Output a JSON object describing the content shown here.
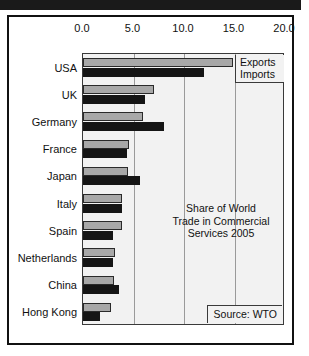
{
  "figure": {
    "inner_title_lines": [
      "Share of World",
      "Trade in Commercial",
      "Services 2005"
    ],
    "source_note": "Source: WTO",
    "legend": [
      "Exports",
      "Imports"
    ]
  },
  "chart_data": {
    "type": "bar",
    "orientation": "horizontal",
    "title": "Share of World Trade in Commercial Services 2005",
    "xlabel": "",
    "ylabel": "",
    "xlim": [
      0.0,
      20.0
    ],
    "xticks": [
      "0.0",
      "5.0",
      "10.0",
      "15.0",
      "20.0"
    ],
    "xtick_values": [
      0.0,
      5.0,
      10.0,
      15.0,
      20.0
    ],
    "grid": true,
    "legend_position": "top-right",
    "source": "Source: WTO",
    "categories": [
      "USA",
      "UK",
      "Germany",
      "France",
      "Japan",
      "Italy",
      "Spain",
      "Netherlands",
      "China",
      "Hong Kong"
    ],
    "series": [
      {
        "name": "Exports",
        "color": "#a8a8a8",
        "values": [
          14.9,
          7.0,
          5.9,
          4.6,
          4.5,
          3.9,
          3.9,
          3.2,
          3.1,
          2.8
        ]
      },
      {
        "name": "Imports",
        "color": "#151515",
        "values": [
          12.0,
          6.1,
          8.0,
          4.4,
          5.6,
          3.9,
          3.0,
          3.0,
          3.6,
          1.7
        ]
      }
    ]
  }
}
